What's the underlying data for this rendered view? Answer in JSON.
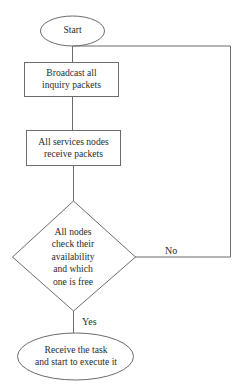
{
  "diagram": {
    "type": "flowchart",
    "colors": {
      "stroke": "#6b6b6b",
      "text": "#2b2b2b",
      "background": "#ffffff"
    },
    "nodes": {
      "start": {
        "shape": "ellipse",
        "label": "Start"
      },
      "broadcast": {
        "shape": "rectangle",
        "line1": "Broadcast all",
        "line2": "inquiry packets"
      },
      "receive_packets": {
        "shape": "rectangle",
        "line1": "All services nodes",
        "line2": "receive packets"
      },
      "decision": {
        "shape": "diamond",
        "line1": "All nodes",
        "line2": "check their",
        "line3": "availability",
        "line4": "and which",
        "line5": "one is free"
      },
      "end": {
        "shape": "ellipse",
        "line1": "Receive the task",
        "line2": "and start to execute it"
      }
    },
    "edges": {
      "no_label": "No",
      "yes_label": "Yes"
    }
  }
}
